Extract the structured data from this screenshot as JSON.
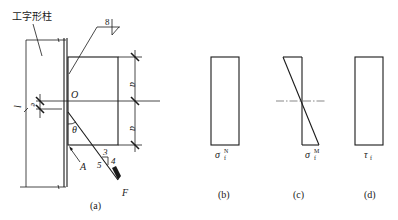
{
  "figure": {
    "panel_a": {
      "caption": "(a)",
      "column_label": "工字形柱",
      "weld_size": "8",
      "point_O": "O",
      "point_A": "A",
      "angle": "θ",
      "dim_a_top": "a",
      "dim_a_bottom": "a",
      "dim_l": "l",
      "dim_e": "e",
      "slope_3": "3",
      "slope_4": "4",
      "slope_5": "5",
      "force": "F"
    },
    "panel_b": {
      "caption": "(b)",
      "stress_symbol": "σ",
      "stress_sup": "N",
      "stress_sub": "f"
    },
    "panel_c": {
      "caption": "(c)",
      "stress_symbol": "σ",
      "stress_sup": "M",
      "stress_sub": "f"
    },
    "panel_d": {
      "caption": "(d)",
      "stress_symbol": "τ",
      "stress_sub": "f"
    }
  }
}
